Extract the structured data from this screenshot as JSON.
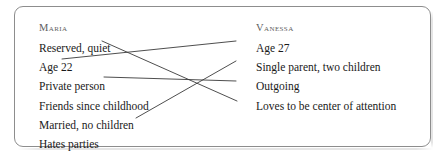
{
  "diagram": {
    "title_visible": false,
    "border_color": "#8d8d8d",
    "background_color": "#ffffff",
    "text_color": "#1a1a1a",
    "heading_color": "#5e5e5e",
    "line_color": "#3a3a3a"
  },
  "columns": {
    "left": {
      "heading": "Maria",
      "items": [
        {
          "label": "Reserved, quiet"
        },
        {
          "label": "Age 22"
        },
        {
          "label": "Private person"
        },
        {
          "label": "Friends since childhood"
        },
        {
          "label": "Married, no children"
        },
        {
          "label": "Hates parties"
        }
      ]
    },
    "right": {
      "heading": "Vanessa",
      "items": [
        {
          "label": "Age 27"
        },
        {
          "label": "Single parent, two children"
        },
        {
          "label": "Outgoing"
        },
        {
          "label": "Loves to be center of attention"
        }
      ]
    }
  },
  "connections": [
    {
      "from": "Reserved, quiet",
      "to": "Loves to be center of attention",
      "x1": 102,
      "y1": 41,
      "x2": 237,
      "y2": 101
    },
    {
      "from": "Age 22",
      "to": "Age 27",
      "x1": 62,
      "y1": 59,
      "x2": 236,
      "y2": 41
    },
    {
      "from": "Private person",
      "to": "Outgoing",
      "x1": 104,
      "y1": 77,
      "x2": 236,
      "y2": 81
    },
    {
      "from": "Married, no children",
      "to": "Single parent, two children",
      "x1": 136,
      "y1": 118,
      "x2": 236,
      "y2": 61
    }
  ]
}
